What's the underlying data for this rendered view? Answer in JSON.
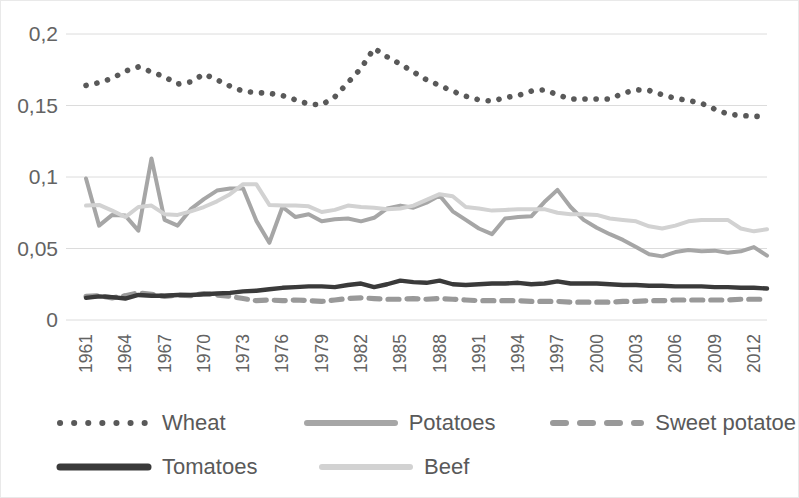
{
  "chart_data": {
    "type": "line",
    "title": "",
    "xlabel": "",
    "ylabel": "",
    "ylim": [
      0,
      0.2
    ],
    "y_ticks": [
      0,
      0.05,
      0.1,
      0.15,
      0.2
    ],
    "y_tick_labels": [
      "0",
      "0,05",
      "0,1",
      "0,15",
      "0,2"
    ],
    "grid": true,
    "legend_position": "bottom",
    "decimal_separator": ",",
    "x_start": 1961,
    "x_end": 2013,
    "x_tick_labels": [
      "1961",
      "1964",
      "1967",
      "1970",
      "1973",
      "1976",
      "1979",
      "1982",
      "1985",
      "1988",
      "1991",
      "1994",
      "1997",
      "2000",
      "2003",
      "2006",
      "2009",
      "2012"
    ],
    "x_tick_years": [
      1961,
      1964,
      1967,
      1970,
      1973,
      1976,
      1979,
      1982,
      1985,
      1988,
      1991,
      1994,
      1997,
      2000,
      2003,
      2006,
      2009,
      2012
    ],
    "x": [
      1961,
      1962,
      1963,
      1964,
      1965,
      1966,
      1967,
      1968,
      1969,
      1970,
      1971,
      1972,
      1973,
      1974,
      1975,
      1976,
      1977,
      1978,
      1979,
      1980,
      1981,
      1982,
      1983,
      1984,
      1985,
      1986,
      1987,
      1988,
      1989,
      1990,
      1991,
      1992,
      1993,
      1994,
      1995,
      1996,
      1997,
      1998,
      1999,
      2000,
      2001,
      2002,
      2003,
      2004,
      2005,
      2006,
      2007,
      2008,
      2009,
      2010,
      2011,
      2012,
      2013
    ],
    "series": [
      {
        "name": "Wheat",
        "style": "dotted",
        "color": "#595959",
        "values": [
          0.164,
          0.166,
          0.169,
          0.174,
          0.177,
          0.1735,
          0.17,
          0.165,
          0.1665,
          0.172,
          0.168,
          0.1635,
          0.16,
          0.159,
          0.1585,
          0.157,
          0.154,
          0.151,
          0.1505,
          0.156,
          0.166,
          0.176,
          0.19,
          0.184,
          0.179,
          0.1735,
          0.168,
          0.164,
          0.16,
          0.1565,
          0.154,
          0.153,
          0.1555,
          0.157,
          0.16,
          0.161,
          0.1575,
          0.1545,
          0.1545,
          0.1545,
          0.1545,
          0.1585,
          0.161,
          0.1605,
          0.1575,
          0.155,
          0.1535,
          0.1515,
          0.1475,
          0.144,
          0.143,
          0.1425,
          0.142
        ]
      },
      {
        "name": "Potatoes",
        "style": "solid",
        "color": "#a6a6a6",
        "values": [
          0.099,
          0.066,
          0.0735,
          0.073,
          0.0625,
          0.113,
          0.07,
          0.066,
          0.0775,
          0.0845,
          0.0905,
          0.092,
          0.092,
          0.0695,
          0.054,
          0.079,
          0.072,
          0.074,
          0.069,
          0.0705,
          0.071,
          0.069,
          0.0715,
          0.078,
          0.08,
          0.0785,
          0.082,
          0.087,
          0.076,
          0.07,
          0.064,
          0.06,
          0.071,
          0.072,
          0.0725,
          0.0825,
          0.091,
          0.079,
          0.07,
          0.0645,
          0.06,
          0.056,
          0.051,
          0.046,
          0.0445,
          0.0475,
          0.049,
          0.048,
          0.0485,
          0.047,
          0.048,
          0.051,
          0.045
        ]
      },
      {
        "name": "Sweet potatoe",
        "style": "dashed",
        "color": "#999999",
        "values": [
          0.0165,
          0.017,
          0.0155,
          0.017,
          0.019,
          0.018,
          0.0165,
          0.0175,
          0.017,
          0.0185,
          0.0175,
          0.0165,
          0.015,
          0.0135,
          0.014,
          0.0135,
          0.014,
          0.0135,
          0.013,
          0.014,
          0.015,
          0.0155,
          0.015,
          0.0145,
          0.0145,
          0.015,
          0.0145,
          0.015,
          0.0145,
          0.014,
          0.0135,
          0.0135,
          0.0135,
          0.0135,
          0.013,
          0.013,
          0.013,
          0.0125,
          0.0125,
          0.0125,
          0.0125,
          0.013,
          0.013,
          0.0135,
          0.0135,
          0.014,
          0.014,
          0.014,
          0.014,
          0.014,
          0.0145,
          0.0145,
          0.0145
        ]
      },
      {
        "name": "Tomatoes",
        "style": "solid",
        "color": "#3a3a3a",
        "values": [
          0.0155,
          0.0165,
          0.016,
          0.015,
          0.0175,
          0.017,
          0.017,
          0.0175,
          0.0175,
          0.018,
          0.0185,
          0.019,
          0.02,
          0.0205,
          0.0215,
          0.0225,
          0.023,
          0.0235,
          0.0235,
          0.023,
          0.0245,
          0.0255,
          0.023,
          0.025,
          0.0275,
          0.0265,
          0.026,
          0.0275,
          0.025,
          0.0245,
          0.025,
          0.0255,
          0.0255,
          0.026,
          0.025,
          0.0255,
          0.027,
          0.0255,
          0.0255,
          0.0255,
          0.025,
          0.0245,
          0.0245,
          0.024,
          0.024,
          0.0235,
          0.0235,
          0.0235,
          0.023,
          0.023,
          0.0225,
          0.0225,
          0.022
        ]
      },
      {
        "name": "Beef",
        "style": "solid",
        "color": "#d2d2d2",
        "values": [
          0.08,
          0.0805,
          0.0765,
          0.072,
          0.079,
          0.08,
          0.074,
          0.0735,
          0.076,
          0.079,
          0.083,
          0.088,
          0.095,
          0.095,
          0.0805,
          0.08,
          0.08,
          0.0795,
          0.0755,
          0.077,
          0.08,
          0.079,
          0.0785,
          0.0775,
          0.078,
          0.08,
          0.084,
          0.088,
          0.0865,
          0.079,
          0.078,
          0.0765,
          0.077,
          0.0775,
          0.0775,
          0.0775,
          0.075,
          0.074,
          0.074,
          0.0735,
          0.071,
          0.07,
          0.069,
          0.0655,
          0.064,
          0.066,
          0.069,
          0.07,
          0.07,
          0.07,
          0.064,
          0.062,
          0.0635
        ]
      }
    ]
  },
  "legend": {
    "rows": [
      [
        {
          "label": "Wheat",
          "style": "dotted",
          "color": "#595959"
        },
        {
          "label": "Potatoes",
          "style": "solid",
          "color": "#a6a6a6"
        },
        {
          "label": "Sweet potatoe",
          "style": "dashed",
          "color": "#999999"
        }
      ],
      [
        {
          "label": "Tomatoes",
          "style": "solid",
          "color": "#3a3a3a"
        },
        {
          "label": "Beef",
          "style": "solid",
          "color": "#d2d2d2"
        }
      ]
    ]
  }
}
